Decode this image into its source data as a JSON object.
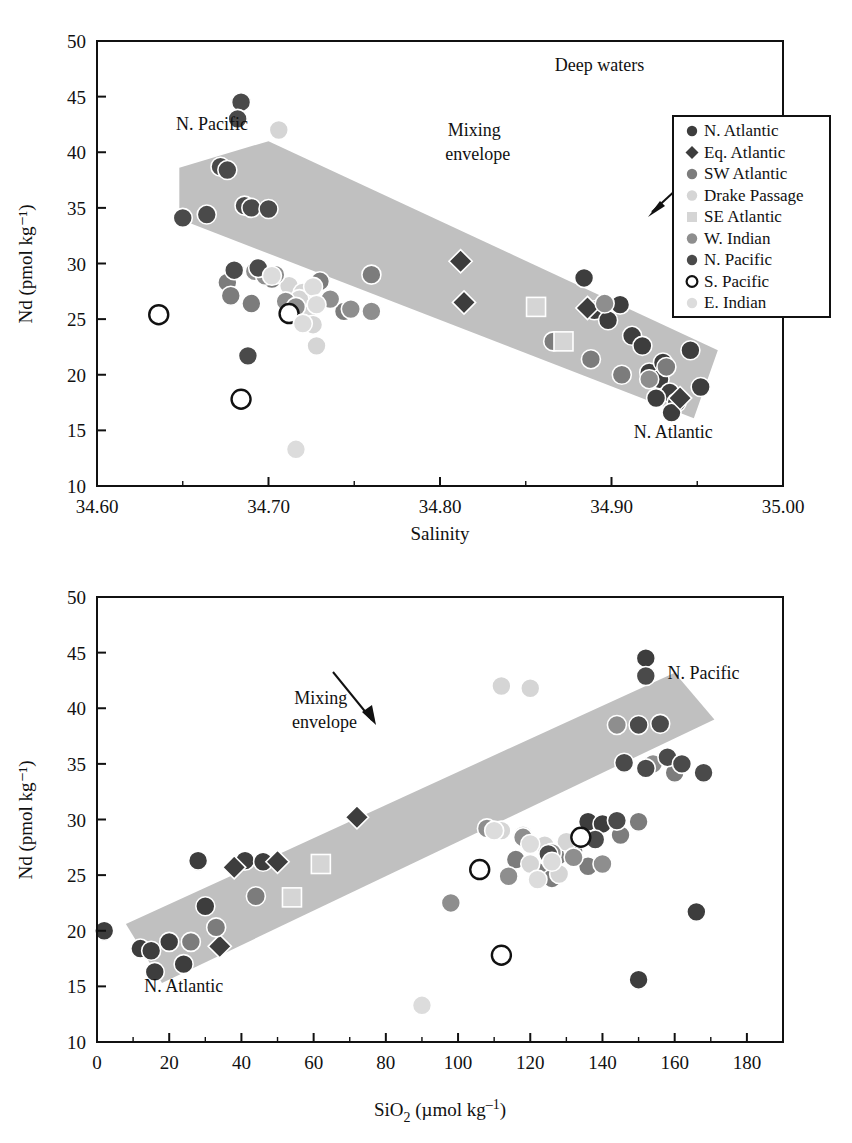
{
  "figure": {
    "background": "#ffffff",
    "envelope_color": "#c0c0c0",
    "panels": [
      "top",
      "bottom"
    ]
  },
  "series_styles": [
    {
      "key": "n_atlantic",
      "label": "N. Atlantic",
      "color": "#3d3d3d",
      "shape": "circle"
    },
    {
      "key": "eq_atlantic",
      "label": "Eq. Atlantic",
      "color": "#3d3d3d",
      "shape": "diamond"
    },
    {
      "key": "sw_atlantic",
      "label": "SW Atlantic",
      "color": "#7c7c7c",
      "shape": "circle"
    },
    {
      "key": "drake_passage",
      "label": "Drake Passage",
      "color": "#d5d5d5",
      "shape": "circle"
    },
    {
      "key": "se_atlantic",
      "label": "SE Atlantic",
      "color": "#d5d5d5",
      "shape": "square"
    },
    {
      "key": "w_indian",
      "label": "W. Indian",
      "color": "#8e8e8e",
      "shape": "circle"
    },
    {
      "key": "n_pacific",
      "label": "N. Pacific",
      "color": "#4a4a4a",
      "shape": "circle"
    },
    {
      "key": "s_pacific",
      "label": "S. Pacific",
      "color": "#ffffff",
      "shape": "circle-open"
    },
    {
      "key": "e_indian",
      "label": "E. Indian",
      "color": "#dcdcdc",
      "shape": "circle"
    }
  ],
  "legend": {
    "position": "top-right-of-upper-panel",
    "entries": [
      "N. Atlantic",
      "Eq. Atlantic",
      "SW Atlantic",
      "Drake Passage",
      "SE Atlantic",
      "W. Indian",
      "N. Pacific",
      "S. Pacific",
      "E. Indian"
    ]
  },
  "chart_data": [
    {
      "id": "nd-vs-salinity",
      "type": "scatter",
      "title": "",
      "xlabel": "Salinity",
      "ylabel": "Nd (pmol kg⁻¹)",
      "xlim": [
        34.6,
        35.0
      ],
      "ylim": [
        10,
        50
      ],
      "xticks": [
        34.6,
        34.7,
        34.8,
        34.9,
        35.0
      ],
      "xticklabels": [
        "34.60",
        "34.70",
        "34.80",
        "34.90",
        "35.00"
      ],
      "yticks": [
        10,
        15,
        20,
        25,
        30,
        35,
        40,
        45,
        50
      ],
      "yticklabels": [
        "10",
        "15",
        "20",
        "25",
        "30",
        "35",
        "40",
        "45",
        "50"
      ],
      "minor_xticks": [
        34.65,
        34.75,
        34.85,
        34.95
      ],
      "grid": false,
      "annotations": [
        {
          "text": "Deep waters",
          "x": 34.893,
          "y": 47.3
        },
        {
          "text": "N. Pacific",
          "x": 34.667,
          "y": 42.0
        },
        {
          "text": "Mixing",
          "x": 34.82,
          "y": 41.5
        },
        {
          "text": "envelope",
          "x": 34.822,
          "y": 39.3
        },
        {
          "text": "N. Atlantic",
          "x": 34.936,
          "y": 14.3
        }
      ],
      "envelope_polygon": [
        [
          34.648,
          38.6
        ],
        [
          34.7,
          41.0
        ],
        [
          34.962,
          22.2
        ],
        [
          34.948,
          16.1
        ],
        [
          34.648,
          34.0
        ]
      ],
      "series": [
        {
          "name": "N. Atlantic",
          "points": [
            [
              34.905,
              26.3
            ],
            [
              34.912,
              23.5
            ],
            [
              34.922,
              20.2
            ],
            [
              34.928,
              19.6
            ],
            [
              34.934,
              18.4
            ],
            [
              34.938,
              17.5
            ],
            [
              34.935,
              16.6
            ],
            [
              34.946,
              22.2
            ],
            [
              34.952,
              18.9
            ],
            [
              34.89,
              25.8
            ],
            [
              34.898,
              24.9
            ],
            [
              34.918,
              22.6
            ],
            [
              34.93,
              21.1
            ],
            [
              34.926,
              17.9
            ],
            [
              34.884,
              28.7
            ]
          ]
        },
        {
          "name": "Eq. Atlantic",
          "points": [
            [
              34.812,
              30.2
            ],
            [
              34.814,
              26.5
            ],
            [
              34.886,
              26.0
            ],
            [
              34.94,
              17.9
            ]
          ]
        },
        {
          "name": "SW Atlantic",
          "points": [
            [
              34.676,
              28.3
            ],
            [
              34.678,
              27.1
            ],
            [
              34.69,
              26.4
            ],
            [
              34.702,
              28.6
            ],
            [
              34.714,
              27.2
            ],
            [
              34.73,
              28.4
            ],
            [
              34.744,
              25.7
            ],
            [
              34.76,
              29.0
            ],
            [
              34.866,
              23.0
            ],
            [
              34.906,
              20.0
            ],
            [
              34.888,
              21.4
            ],
            [
              34.932,
              20.7
            ]
          ]
        },
        {
          "name": "Drake Passage",
          "points": [
            [
              34.712,
              28.0
            ],
            [
              34.72,
              27.4
            ],
            [
              34.722,
              25.3
            ],
            [
              34.726,
              24.5
            ],
            [
              34.728,
              22.6
            ],
            [
              34.706,
              42.0
            ],
            [
              34.718,
              26.8
            ]
          ]
        },
        {
          "name": "SE Atlantic",
          "points": [
            [
              34.856,
              26.1
            ],
            [
              34.872,
              23.0
            ]
          ]
        },
        {
          "name": "W. Indian",
          "points": [
            [
              34.692,
              29.3
            ],
            [
              34.698,
              28.9
            ],
            [
              34.704,
              29.0
            ],
            [
              34.71,
              26.6
            ],
            [
              34.716,
              26.1
            ],
            [
              34.736,
              26.8
            ],
            [
              34.748,
              25.9
            ],
            [
              34.76,
              25.7
            ],
            [
              34.896,
              26.4
            ],
            [
              34.922,
              19.6
            ]
          ]
        },
        {
          "name": "N. Pacific",
          "points": [
            [
              34.684,
              44.5
            ],
            [
              34.682,
              43.0
            ],
            [
              34.672,
              38.7
            ],
            [
              34.676,
              38.4
            ],
            [
              34.686,
              35.2
            ],
            [
              34.69,
              35.0
            ],
            [
              34.7,
              34.9
            ],
            [
              34.65,
              34.1
            ],
            [
              34.664,
              34.4
            ],
            [
              34.694,
              29.6
            ],
            [
              34.68,
              29.4
            ],
            [
              34.688,
              21.7
            ]
          ]
        },
        {
          "name": "S. Pacific",
          "points": [
            [
              34.636,
              25.4
            ],
            [
              34.712,
              25.5
            ],
            [
              34.684,
              17.8
            ]
          ]
        },
        {
          "name": "E. Indian",
          "points": [
            [
              34.702,
              28.9
            ],
            [
              34.726,
              27.9
            ],
            [
              34.728,
              26.3
            ],
            [
              34.72,
              24.6
            ],
            [
              34.716,
              13.3
            ]
          ]
        }
      ]
    },
    {
      "id": "nd-vs-sio2",
      "type": "scatter",
      "title": "",
      "xlabel": "SiO₂ (µmol kg⁻¹)",
      "ylabel": "Nd (pmol kg⁻¹)",
      "xlim": [
        0,
        190
      ],
      "ylim": [
        10,
        50
      ],
      "xticks": [
        0,
        20,
        40,
        60,
        80,
        100,
        120,
        140,
        160,
        180
      ],
      "xticklabels": [
        "0",
        "20",
        "40",
        "60",
        "80",
        "100",
        "120",
        "140",
        "160",
        "180"
      ],
      "yticks": [
        10,
        15,
        20,
        25,
        30,
        35,
        40,
        45,
        50
      ],
      "yticklabels": [
        "10",
        "15",
        "20",
        "25",
        "30",
        "35",
        "40",
        "45",
        "50"
      ],
      "minor_xticks": [
        10,
        30,
        50,
        70,
        90,
        110,
        130,
        150,
        170
      ],
      "grid": false,
      "annotations": [
        {
          "text": "Mixing",
          "x": 62,
          "y": 40.4
        },
        {
          "text": "envelope",
          "x": 63,
          "y": 38.2
        },
        {
          "text": "N. Pacific",
          "x": 168,
          "y": 42.6
        },
        {
          "text": "N. Atlantic",
          "x": 24,
          "y": 14.5
        }
      ],
      "envelope_polygon": [
        [
          8,
          20.6
        ],
        [
          160,
          43.2
        ],
        [
          171,
          39.0
        ],
        [
          18,
          15.3
        ]
      ],
      "series": [
        {
          "name": "N. Atlantic",
          "points": [
            [
              2,
              20.0
            ],
            [
              12,
              18.4
            ],
            [
              15,
              18.2
            ],
            [
              20,
              19.0
            ],
            [
              28,
              26.3
            ],
            [
              30,
              22.2
            ],
            [
              41,
              26.3
            ],
            [
              46,
              26.2
            ],
            [
              24,
              17.0
            ],
            [
              16,
              16.3
            ],
            [
              152,
              44.5
            ],
            [
              150,
              15.6
            ],
            [
              166,
              21.7
            ],
            [
              136,
              29.8
            ],
            [
              140,
              29.6
            ]
          ]
        },
        {
          "name": "Eq. Atlantic",
          "points": [
            [
              38,
              25.7
            ],
            [
              50,
              26.2
            ],
            [
              72,
              30.2
            ],
            [
              34,
              18.6
            ]
          ]
        },
        {
          "name": "SW Atlantic",
          "points": [
            [
              44,
              23.1
            ],
            [
              128,
              26.8
            ],
            [
              132,
              27.2
            ],
            [
              136,
              25.8
            ],
            [
              145,
              28.6
            ],
            [
              150,
              29.8
            ],
            [
              122,
              25.3
            ],
            [
              116,
              26.4
            ],
            [
              26,
              19.0
            ],
            [
              33,
              20.3
            ],
            [
              126,
              24.7
            ],
            [
              160,
              34.2
            ]
          ]
        },
        {
          "name": "Drake Passage",
          "points": [
            [
              112,
              29.0
            ],
            [
              118,
              28.6
            ],
            [
              124,
              27.7
            ],
            [
              130,
              28.0
            ],
            [
              120,
              26.0
            ],
            [
              112,
              42.0
            ],
            [
              120,
              41.8
            ],
            [
              128,
              25.1
            ]
          ]
        },
        {
          "name": "SE Atlantic",
          "points": [
            [
              62,
              26.0
            ],
            [
              54,
              23.0
            ]
          ]
        },
        {
          "name": "W. Indian",
          "points": [
            [
              108,
              29.2
            ],
            [
              118,
              28.4
            ],
            [
              126,
              27.0
            ],
            [
              132,
              26.6
            ],
            [
              134,
              28.3
            ],
            [
              140,
              26.0
            ],
            [
              98,
              22.5
            ],
            [
              114,
              24.9
            ],
            [
              144,
              38.5
            ],
            [
              154,
              35.0
            ]
          ]
        },
        {
          "name": "N. Pacific",
          "points": [
            [
              152,
              42.9
            ],
            [
              150,
              38.5
            ],
            [
              156,
              38.6
            ],
            [
              158,
              35.6
            ],
            [
              146,
              35.1
            ],
            [
              152,
              34.6
            ],
            [
              162,
              35.0
            ],
            [
              168,
              34.2
            ],
            [
              144,
              29.9
            ],
            [
              138,
              28.2
            ],
            [
              125,
              26.9
            ]
          ]
        },
        {
          "name": "S. Pacific",
          "points": [
            [
              106,
              25.5
            ],
            [
              134,
              28.4
            ],
            [
              112,
              17.8
            ]
          ]
        },
        {
          "name": "E. Indian",
          "points": [
            [
              110,
              29.0
            ],
            [
              120,
              27.8
            ],
            [
              126,
              26.2
            ],
            [
              122,
              24.6
            ],
            [
              90,
              13.3
            ]
          ]
        }
      ]
    }
  ]
}
